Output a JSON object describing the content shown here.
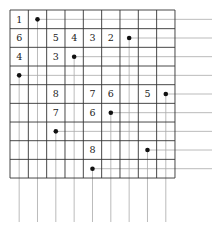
{
  "puzzle": {
    "rows": 9,
    "cols": 9,
    "grid_origin": [
      10,
      10
    ],
    "cell_w": 18.33,
    "cell_h": 18.67,
    "guide_line_right_end": 212,
    "guide_line_bottom_end": 222,
    "colors": {
      "grid": "#333333",
      "guide": "#aaaaaa",
      "dot": "#111111",
      "text": "#222222"
    },
    "numbers": [
      {
        "row": 0,
        "col": 0,
        "value": "1"
      },
      {
        "row": 1,
        "col": 0,
        "value": "6"
      },
      {
        "row": 1,
        "col": 2,
        "value": "5"
      },
      {
        "row": 1,
        "col": 3,
        "value": "4"
      },
      {
        "row": 1,
        "col": 4,
        "value": "3"
      },
      {
        "row": 1,
        "col": 5,
        "value": "2"
      },
      {
        "row": 2,
        "col": 0,
        "value": "4"
      },
      {
        "row": 2,
        "col": 2,
        "value": "3"
      },
      {
        "row": 4,
        "col": 2,
        "value": "8"
      },
      {
        "row": 4,
        "col": 4,
        "value": "7"
      },
      {
        "row": 4,
        "col": 5,
        "value": "6"
      },
      {
        "row": 4,
        "col": 7,
        "value": "5"
      },
      {
        "row": 5,
        "col": 2,
        "value": "7"
      },
      {
        "row": 5,
        "col": 4,
        "value": "6"
      },
      {
        "row": 7,
        "col": 4,
        "value": "8"
      }
    ],
    "dots": [
      {
        "row": 0,
        "col": 1
      },
      {
        "row": 1,
        "col": 6
      },
      {
        "row": 2,
        "col": 3
      },
      {
        "row": 3,
        "col": 0
      },
      {
        "row": 4,
        "col": 8
      },
      {
        "row": 5,
        "col": 5
      },
      {
        "row": 6,
        "col": 2
      },
      {
        "row": 7,
        "col": 7
      },
      {
        "row": 8,
        "col": 4
      }
    ]
  }
}
